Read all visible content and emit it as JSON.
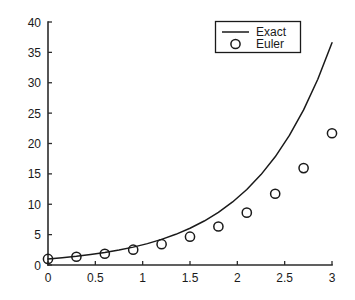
{
  "chart_data": {
    "type": "line",
    "title": "",
    "xlabel": "",
    "ylabel": "",
    "xlim": [
      0,
      3
    ],
    "ylim": [
      0,
      40
    ],
    "grid": false,
    "legend_position": "top-right",
    "xticks": [
      0,
      0.5,
      1,
      1.5,
      2,
      2.5,
      3
    ],
    "xtick_labels": [
      "0",
      "0.5",
      "1",
      "1.5",
      "2",
      "2.5",
      "3"
    ],
    "yticks": [
      0,
      5,
      10,
      15,
      20,
      25,
      30,
      35,
      40
    ],
    "ytick_labels": [
      "0",
      "5",
      "10",
      "15",
      "20",
      "25",
      "30",
      "35",
      "40"
    ],
    "series": [
      {
        "name": "Exact",
        "type": "line",
        "style": "solid",
        "color": "#1a1a1a",
        "x": [
          0,
          0.15,
          0.3,
          0.45,
          0.6,
          0.75,
          0.9,
          1.05,
          1.2,
          1.35,
          1.5,
          1.65,
          1.8,
          1.95,
          2.1,
          2.25,
          2.4,
          2.55,
          2.7,
          2.85,
          3
        ],
        "values": [
          1.0,
          1.2,
          1.43,
          1.72,
          2.05,
          2.46,
          2.94,
          3.52,
          4.22,
          5.05,
          6.05,
          7.24,
          8.67,
          10.38,
          12.43,
          14.88,
          17.81,
          21.33,
          25.53,
          30.57,
          36.6
        ]
      },
      {
        "name": "Euler",
        "type": "scatter",
        "marker": "circle-open",
        "color": "#1a1a1a",
        "x": [
          0,
          0.3,
          0.6,
          0.9,
          1.2,
          1.5,
          1.8,
          2.1,
          2.4,
          2.7,
          3
        ],
        "values": [
          1.0,
          1.36,
          1.85,
          2.52,
          3.43,
          4.66,
          6.34,
          8.62,
          11.73,
          15.95,
          21.69
        ]
      }
    ],
    "legend": [
      {
        "label": "Exact",
        "marker": "line"
      },
      {
        "label": "Euler",
        "marker": "circle-open"
      }
    ]
  },
  "colors": {
    "background": "#ffffff",
    "axis": "#2b2b2b",
    "foreground": "#1a1a1a"
  }
}
